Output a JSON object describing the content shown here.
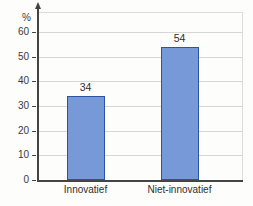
{
  "chart_data": {
    "type": "bar",
    "title": "",
    "xlabel": "",
    "ylabel": "%",
    "categories": [
      "Innovatief",
      "Niet-innovatief"
    ],
    "values": [
      34,
      54
    ],
    "value_labels": [
      "34",
      "54"
    ],
    "ylim": [
      0,
      60
    ],
    "yticks": [
      0,
      10,
      20,
      30,
      40,
      50,
      60
    ],
    "grid": "horizontal",
    "legend_position": "none",
    "colors": {
      "bar_fill": "#7899d8",
      "bar_border": "#2d54a4",
      "gridline": "#d6d6d3",
      "frame": "#dcdcda",
      "axis": "#444444",
      "text": "#2f2f2f",
      "background": "#fdfdfb"
    }
  }
}
